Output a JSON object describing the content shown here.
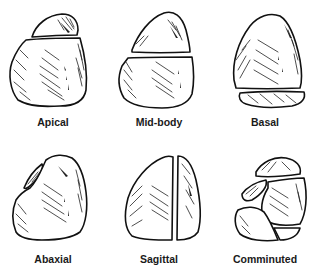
{
  "figure": {
    "type": "diagram",
    "panels": [
      {
        "id": "apical",
        "label": "Apical",
        "fracture": "horizontal line near top separating apex fragment"
      },
      {
        "id": "mid-body",
        "label": "Mid-body",
        "fracture": "horizontal line across middle"
      },
      {
        "id": "basal",
        "label": "Basal",
        "fracture": "horizontal line near base separating base fragment"
      },
      {
        "id": "abaxial",
        "label": "Abaxial",
        "fracture": "small sliver fragment separated from left side"
      },
      {
        "id": "sagittal",
        "label": "Sagittal",
        "fracture": "vertical line splitting bone"
      },
      {
        "id": "comminuted",
        "label": "Comminuted",
        "fracture": "multiple fragments"
      }
    ],
    "colors": {
      "line": "#111111",
      "background": "#ffffff",
      "label": "#1a1a1a"
    }
  }
}
